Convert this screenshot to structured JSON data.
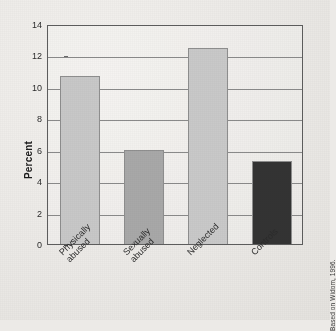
{
  "chart_data": {
    "type": "bar",
    "title": "",
    "subtitle": "",
    "xlabel": "",
    "ylabel": "Percent",
    "ylim": [
      0,
      14
    ],
    "ytick_step": 2,
    "yticks": [
      0,
      2,
      4,
      6,
      8,
      10,
      12,
      14
    ],
    "ytick_labels": [
      "0",
      "2",
      "4",
      "6",
      "8",
      "10",
      "12",
      "14"
    ],
    "grid": true,
    "grid_axis": "y",
    "legend": false,
    "legend_position": "none",
    "categories": [
      "Physically abused",
      "Sexually abused",
      "Neglected",
      "Controls"
    ],
    "category_lines": [
      [
        "Physically",
        "abused"
      ],
      [
        "Sexually",
        "abused"
      ],
      [
        "Neglected"
      ],
      [
        "Controls"
      ]
    ],
    "values": [
      10.7,
      6.0,
      12.5,
      5.3
    ],
    "bar_colors": [
      "#c8c8c8",
      "#a8a8a8",
      "#c9c9c9",
      "#333333"
    ],
    "bar_edge_color": "#8e8e8e",
    "value_unit": "percent",
    "annotations": []
  },
  "figure": {
    "background_color": "#eceae7",
    "frame_color": "#5d5d5d",
    "gridline_color": "#8a8a8a",
    "source_credit": "Based on Widom, 1996."
  }
}
